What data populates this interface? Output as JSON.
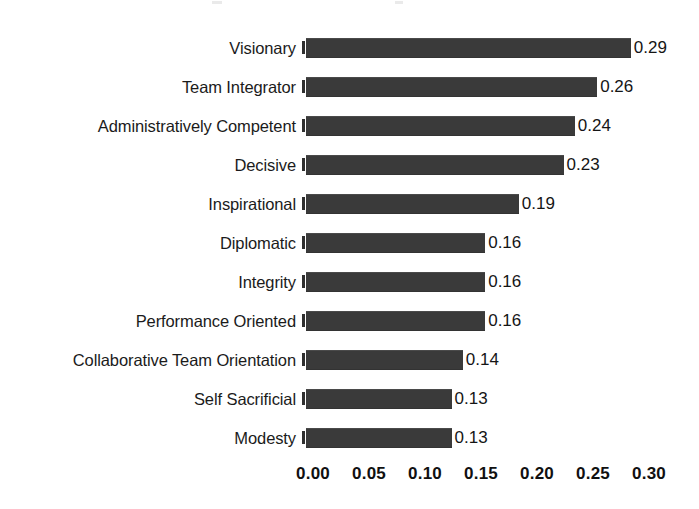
{
  "chart_data": {
    "type": "bar",
    "orientation": "horizontal",
    "title": "",
    "subtitle": "",
    "xlabel": "",
    "ylabel": "",
    "categories": [
      "Visionary",
      "Team Integrator",
      "Administratively Competent",
      "Decisive",
      "Inspirational",
      "Diplomatic",
      "Integrity",
      "Performance Oriented",
      "Collaborative Team Orientation",
      "Self Sacrificial",
      "Modesty"
    ],
    "values": [
      0.29,
      0.26,
      0.24,
      0.23,
      0.19,
      0.16,
      0.16,
      0.16,
      0.14,
      0.13,
      0.13
    ],
    "value_labels": [
      "0.29",
      "0.26",
      "0.24",
      "0.23",
      "0.19",
      "0.16",
      "0.16",
      "0.16",
      "0.14",
      "0.13",
      "0.13"
    ],
    "xlim": [
      0.0,
      0.3
    ],
    "xticks": [
      0.0,
      0.05,
      0.1,
      0.15,
      0.2,
      0.25,
      0.3
    ],
    "xtick_labels": [
      "0.00",
      "0.05",
      "0.10",
      "0.15",
      "0.20",
      "0.25",
      "0.30"
    ],
    "grid": false,
    "legend": false,
    "bar_color": "#3a3a3a",
    "text_color": "#1a1a1a",
    "background": "#ffffff",
    "data_labels_shown": true
  }
}
